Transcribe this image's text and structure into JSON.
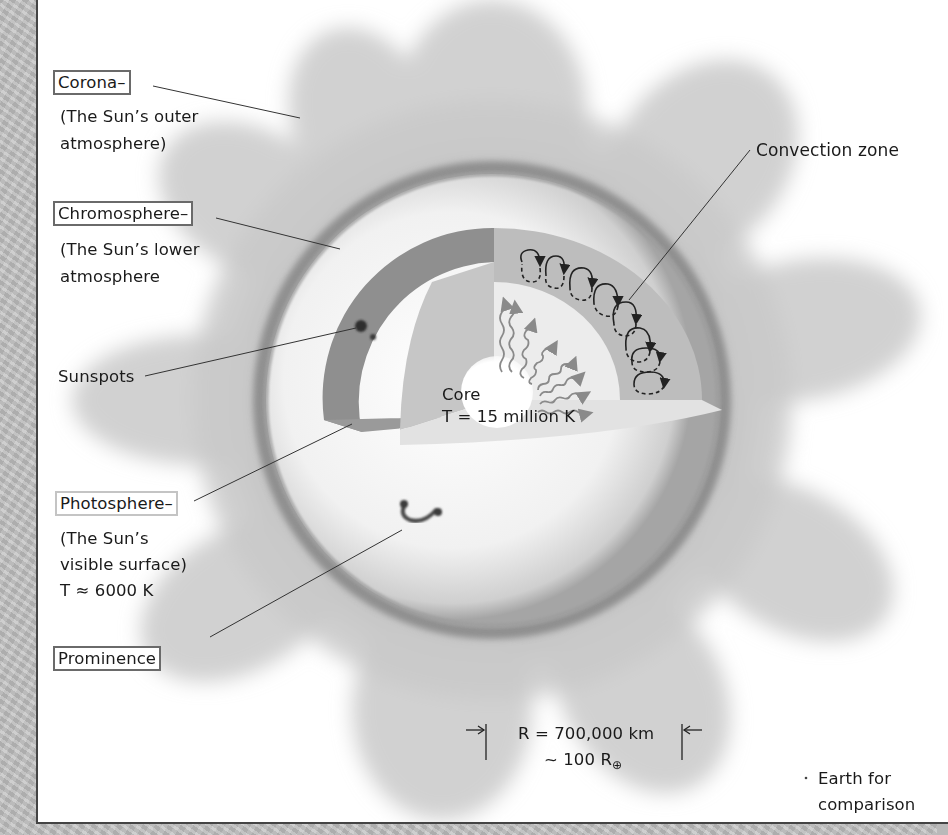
{
  "diagram": {
    "labels": {
      "corona": {
        "name": "Corona–",
        "desc_line1": "(The Sun’s outer",
        "desc_line2": "atmosphere)"
      },
      "chromosphere": {
        "name": "Chromosphere–",
        "desc_line1": "(The Sun’s lower",
        "desc_line2": "atmosphere"
      },
      "sunspots": {
        "name": "Sunspots"
      },
      "photosphere": {
        "name": "Photosphere–",
        "desc_line1": "(The Sun’s",
        "desc_line2": "visible surface)",
        "desc_line3": "T ≈ 6000 K"
      },
      "prominence": {
        "name": "Prominence"
      },
      "convection_zone": {
        "name": "Convection zone"
      },
      "core": {
        "name": "Core",
        "temperature": "T = 15 million K"
      },
      "earth": {
        "bullet": "·",
        "line1": "Earth for",
        "line2": "comparison"
      },
      "radius": {
        "line1": "R = 700,000 km",
        "line2_prefix": "~ 100 R",
        "line2_sub": "⊕"
      }
    },
    "colors": {
      "panel_bg": "#ffffff",
      "outer_bg": "#bdbdbd",
      "corona": "#c8c8c8",
      "photosphere": "#f2f2f2",
      "shell": "#8e8e8e",
      "radiative_zone": "#c9c9c9",
      "core_glow": "#ffffff",
      "text": "#1a1a1a"
    }
  }
}
